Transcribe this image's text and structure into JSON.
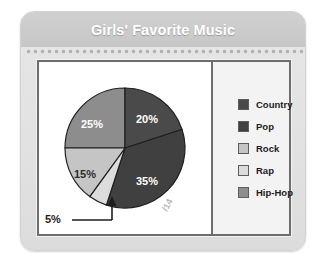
{
  "card": {
    "title": "Girls' Favorite Music"
  },
  "colors": {
    "country": "#4a4a4a",
    "pop": "#404040",
    "rock": "#c5c5c5",
    "rap": "#dcdcdc",
    "hiphop": "#8d8d8d",
    "slice_outline": "#1f1f1f",
    "panel_border": "#6d6d6d",
    "header_band": "#c9c9c9",
    "card_background": "#e3e3e3",
    "title_text": "#ffffff"
  },
  "legend": {
    "items": [
      {
        "label": "Country",
        "color_key": "country",
        "swatch_name": "legend-swatch-country"
      },
      {
        "label": "Pop",
        "color_key": "pop",
        "swatch_name": "legend-swatch-pop"
      },
      {
        "label": "Rock",
        "color_key": "rock",
        "swatch_name": "legend-swatch-rock"
      },
      {
        "label": "Rap",
        "color_key": "rap",
        "swatch_name": "legend-swatch-rap"
      },
      {
        "label": "Hip-Hop",
        "color_key": "hiphop",
        "swatch_name": "legend-swatch-hiphop"
      }
    ]
  },
  "callout": {
    "label": "5%",
    "points_to": "Rap"
  },
  "watermark": {
    "text": "/14"
  },
  "chart_data": {
    "type": "pie",
    "title": "Girls' Favorite Music",
    "xlabel": "",
    "ylabel": "",
    "legend_position": "right",
    "grid": false,
    "value_unit": "percent",
    "start_angle_deg": 0,
    "direction": "clockwise",
    "categories": [
      "Country",
      "Pop",
      "Rap",
      "Rock",
      "Hip-Hop"
    ],
    "values": [
      20,
      35,
      5,
      15,
      25
    ],
    "labels": [
      "20%",
      "35%",
      "5%",
      "15%",
      "25%"
    ],
    "slices": [
      {
        "name": "Country",
        "value": 20,
        "label": "20%",
        "color": "#4a4a4a",
        "label_inside": true
      },
      {
        "name": "Pop",
        "value": 35,
        "label": "35%",
        "color": "#404040",
        "label_inside": true
      },
      {
        "name": "Rap",
        "value": 5,
        "label": "5%",
        "color": "#dcdcdc",
        "label_inside": false
      },
      {
        "name": "Rock",
        "value": 15,
        "label": "15%",
        "color": "#c5c5c5",
        "label_inside": true
      },
      {
        "name": "Hip-Hop",
        "value": 25,
        "label": "25%",
        "color": "#8d8d8d",
        "label_inside": true
      }
    ],
    "annotations": [
      {
        "text": "5%",
        "target": "Rap",
        "style": "leader-line-with-arrow"
      }
    ],
    "total": 100
  }
}
